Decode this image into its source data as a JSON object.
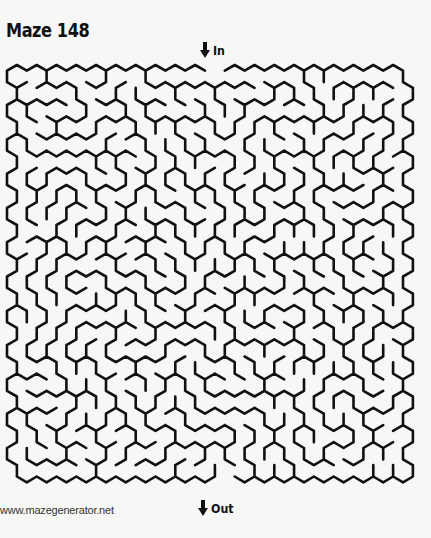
{
  "title": "Maze 148",
  "entry": {
    "label": "In",
    "icon": "down-arrow-icon"
  },
  "exit": {
    "label": "Out",
    "icon": "down-arrow-icon"
  },
  "credit": "www.mazegenerator.net",
  "maze": {
    "shape": "hexagonal-cells",
    "columns": 20,
    "rows": 24,
    "cell_width": 19.8,
    "origin_x": 7,
    "origin_y": 65,
    "entry_column": 10,
    "exit_column": 10,
    "wall_color": "#111111",
    "wall_width": 2.6,
    "background": "#f7f7f6"
  }
}
